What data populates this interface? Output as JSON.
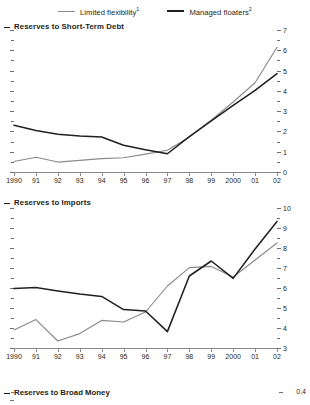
{
  "legend": {
    "items": [
      {
        "name": "Limited flexibility",
        "sup": "1",
        "color": "#8a8a8a",
        "style": "gray"
      },
      {
        "name": "Managed floaters",
        "sup": "2",
        "color": "#231f20",
        "style": "black"
      }
    ]
  },
  "x_labels": [
    "1990",
    "91",
    "92",
    "93",
    "94",
    "95",
    "96",
    "97",
    "98",
    "99",
    "2000",
    "01",
    "02"
  ],
  "chart_data": [
    {
      "type": "line",
      "title": "Reserves to Short-Term Debt",
      "xlabel": "",
      "ylabel": "",
      "x": [
        "1990",
        "91",
        "92",
        "93",
        "94",
        "95",
        "96",
        "97",
        "98",
        "99",
        "2000",
        "01",
        "02"
      ],
      "ylim": [
        0,
        7
      ],
      "yticks": [
        0,
        1,
        2,
        3,
        4,
        5,
        6,
        7
      ],
      "ytick_labels": [
        "0",
        "1",
        "2",
        "3",
        "4",
        "5",
        "6",
        "7"
      ],
      "minor_ticks": true,
      "grid": false,
      "legend_position": "top-center",
      "series": [
        {
          "name": "Limited flexibility",
          "color": "#8a8a8a",
          "values": [
            0.52,
            0.73,
            0.49,
            0.57,
            0.66,
            0.7,
            0.88,
            1.07,
            1.72,
            2.55,
            3.45,
            4.4,
            6.15
          ]
        },
        {
          "name": "Managed floaters",
          "color": "#231f20",
          "values": [
            2.3,
            2.05,
            1.86,
            1.77,
            1.73,
            1.32,
            1.1,
            0.9,
            1.74,
            2.52,
            3.28,
            4.02,
            4.85
          ]
        }
      ]
    },
    {
      "type": "line",
      "title": "Reserves to Imports",
      "xlabel": "",
      "ylabel": "",
      "x": [
        "1990",
        "91",
        "92",
        "93",
        "94",
        "95",
        "96",
        "97",
        "98",
        "99",
        "2000",
        "01",
        "02"
      ],
      "ylim": [
        3,
        10
      ],
      "yticks": [
        3,
        4,
        5,
        6,
        7,
        8,
        9,
        10
      ],
      "ytick_labels": [
        "3",
        "4",
        "5",
        "6",
        "7",
        "8",
        "9",
        "10"
      ],
      "minor_ticks": true,
      "grid": false,
      "legend_position": "top-center",
      "series": [
        {
          "name": "Limited flexibility",
          "color": "#8a8a8a",
          "values": [
            3.9,
            4.42,
            3.35,
            3.72,
            4.38,
            4.3,
            4.8,
            6.1,
            7.02,
            7.08,
            6.55,
            7.4,
            8.25
          ]
        },
        {
          "name": "Managed floaters",
          "color": "#231f20",
          "values": [
            5.97,
            6.02,
            5.85,
            5.7,
            5.58,
            4.92,
            4.85,
            3.82,
            6.6,
            7.35,
            6.48,
            7.95,
            9.32
          ]
        }
      ]
    },
    {
      "type": "line",
      "title": "Reserves to Broad Money",
      "xlabel": "",
      "ylabel": "",
      "x": [],
      "ylim": [
        null,
        0.4
      ],
      "yticks": [
        0.4
      ],
      "ytick_labels": [
        "0.4"
      ],
      "minor_ticks": true,
      "grid": false,
      "clipped": true,
      "series": []
    }
  ]
}
